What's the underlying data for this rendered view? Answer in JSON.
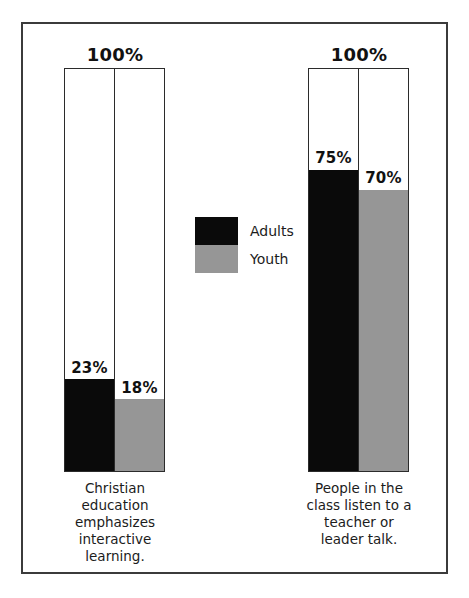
{
  "chart_data": {
    "type": "bar",
    "title": "",
    "subtitle": "",
    "xlabel": "",
    "ylabel": "",
    "ylim": [
      0,
      100
    ],
    "grid": false,
    "legend_position": "center",
    "value_suffix": "%",
    "total_label": "100%",
    "categories": [
      "Christian education emphasizes interactive learning.",
      "People in the class listen to a teacher or leader talk."
    ],
    "series": [
      {
        "name": "Adults",
        "color": "#0a0a0a",
        "values": [
          23,
          75
        ]
      },
      {
        "name": "Youth",
        "color": "#969696",
        "values": [
          18,
          70
        ]
      }
    ]
  },
  "frame": {
    "border_color": "#3b3b3b"
  },
  "groups": [
    {
      "total": "100%",
      "caption": "Christian\neducation\nemphasizes\ninteractive\nlearning.",
      "caption_lines": [
        "Christian",
        "education",
        "emphasizes",
        "interactive",
        "learning."
      ],
      "bars": [
        {
          "series": "Adults",
          "label": "23%",
          "value": 23
        },
        {
          "series": "Youth",
          "label": "18%",
          "value": 18
        }
      ]
    },
    {
      "total": "100%",
      "caption": "People in the\nclass listen to a\nteacher or\nleader talk.",
      "caption_lines": [
        "People in the",
        "class listen to a",
        "teacher or",
        "leader talk."
      ],
      "bars": [
        {
          "series": "Adults",
          "label": "75%",
          "value": 75
        },
        {
          "series": "Youth",
          "label": "70%",
          "value": 70
        }
      ]
    }
  ],
  "legend": {
    "items": [
      {
        "label": "Adults",
        "color": "#0a0a0a"
      },
      {
        "label": "Youth",
        "color": "#969696"
      }
    ]
  },
  "colors": {
    "adults": "#0a0a0a",
    "youth": "#969696",
    "frame": "#3b3b3b",
    "text": "#1c1c1c",
    "background": "#ffffff"
  }
}
